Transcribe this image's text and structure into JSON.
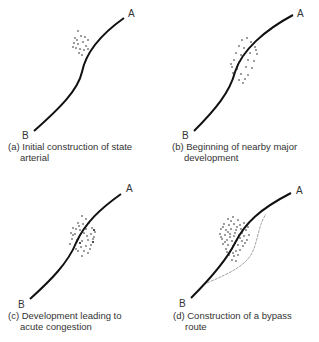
{
  "panels": [
    {
      "id": "a",
      "caption_line1": "(a) Initial construction of state",
      "caption_line2": "arterial",
      "label_a": "A",
      "label_b": "B"
    },
    {
      "id": "b",
      "caption_line1": "(b) Beginning of nearby major",
      "caption_line2": "development",
      "label_a": "A",
      "label_b": "B"
    },
    {
      "id": "c",
      "caption_line1": "(c) Development leading to",
      "caption_line2": "acute congestion",
      "label_a": "A",
      "label_b": "B"
    },
    {
      "id": "d",
      "caption_line1": "(d) Construction of a bypass",
      "caption_line2": "route",
      "label_a": "A",
      "label_b": "B"
    }
  ],
  "colors": {
    "road": "#111111",
    "bypass": "#777777",
    "dots": "#222222"
  }
}
